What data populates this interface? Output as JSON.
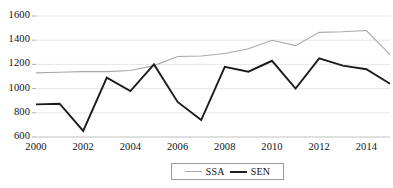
{
  "chart_data": {
    "type": "line",
    "title": "",
    "xlabel": "",
    "ylabel": "",
    "x": [
      2000,
      2001,
      2002,
      2003,
      2004,
      2005,
      2006,
      2007,
      2008,
      2009,
      2010,
      2011,
      2012,
      2013,
      2014,
      2015
    ],
    "xlim": [
      2000,
      2015
    ],
    "ylim": [
      600,
      1600
    ],
    "grid": true,
    "legend_position": "bottom-center",
    "x_tick_labels": [
      "2000",
      "2002",
      "2004",
      "2006",
      "2008",
      "2010",
      "2012",
      "2014"
    ],
    "x_tick_values": [
      2000,
      2002,
      2004,
      2006,
      2008,
      2010,
      2012,
      2014
    ],
    "y_tick_labels": [
      "600",
      "800",
      "1000",
      "1200",
      "1400",
      "1600"
    ],
    "y_tick_values": [
      600,
      800,
      1000,
      1200,
      1400,
      1600
    ],
    "series": [
      {
        "name": "SSA",
        "color": "#a8a8a8",
        "width": 1.1,
        "values": [
          1130,
          1135,
          1140,
          1140,
          1150,
          1190,
          1265,
          1270,
          1290,
          1330,
          1400,
          1355,
          1465,
          1470,
          1480,
          1280
        ]
      },
      {
        "name": "SEN",
        "color": "#1c1c1c",
        "width": 1.9,
        "values": [
          870,
          875,
          650,
          1090,
          980,
          1200,
          890,
          740,
          1180,
          1140,
          1230,
          1000,
          1250,
          1190,
          1160,
          1040
        ]
      }
    ]
  },
  "legend": {
    "items": [
      {
        "label": "SSA",
        "key": "ssa"
      },
      {
        "label": "SEN",
        "key": "sen"
      }
    ]
  }
}
